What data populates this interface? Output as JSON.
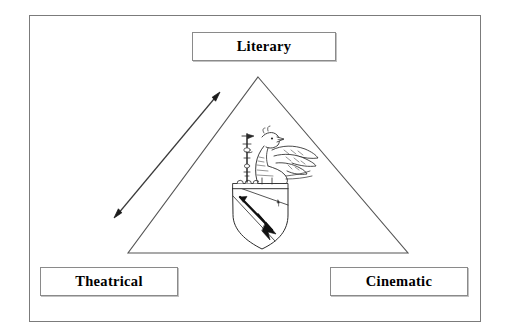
{
  "figure": {
    "type": "triangle-model-diagram",
    "background_color": "#ffffff",
    "line_color": "#555555",
    "frame_color": "#7b7b7b",
    "text_color": "#000000"
  },
  "labels": {
    "apex": "Literary",
    "bottom_left": "Theatrical",
    "bottom_right": "Cinematic"
  },
  "triangle": {
    "apex": "258,77",
    "bottom_left": "128,253",
    "bottom_right": "408,253"
  },
  "arrow": {
    "name": "double-headed-arrow",
    "heads": "both",
    "from": "114,218",
    "to": "220,92",
    "orientation": "parallel-to-left-edge"
  },
  "emblem": {
    "name": "heraldic-crest",
    "description": "winged griffin holding a staff standing on a crowned shield bearing a diagonal bend with a lance",
    "components": [
      "griffin",
      "wings",
      "staff",
      "coronet",
      "shield",
      "bend",
      "lance"
    ]
  }
}
